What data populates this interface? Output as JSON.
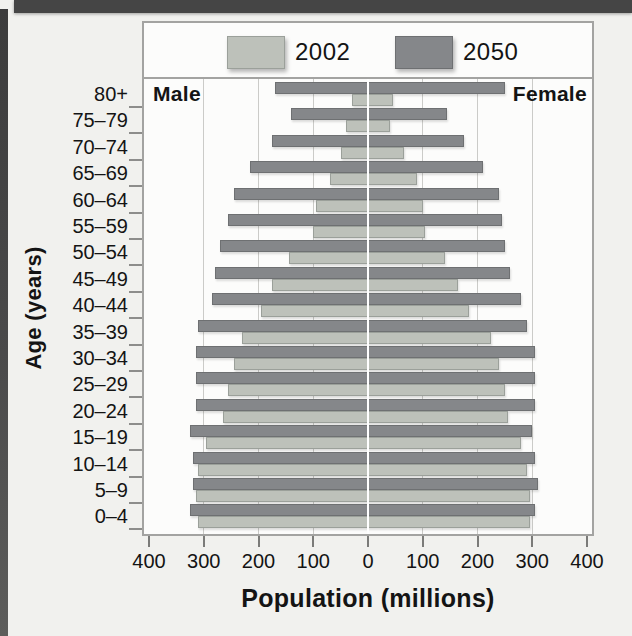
{
  "colors": {
    "page_bg": "#f1f1ee",
    "chart_bg": "#fcfcfb",
    "frame": "#a3a3a1",
    "grid": "#cbcbc8",
    "center_line": "#ffffff",
    "top_rule": "#454545",
    "text": "#141414"
  },
  "legend": {
    "items": [
      {
        "label": "2002",
        "color": "#bdc1ba",
        "border": "#9ba09a"
      },
      {
        "label": "2050",
        "color": "#85878a",
        "border": "#6e7072"
      }
    ]
  },
  "chart_data": {
    "type": "bar",
    "variant": "population_pyramid",
    "title": "",
    "xlabel": "Population (millions)",
    "ylabel": "Age (years)",
    "left_side_label": "Male",
    "right_side_label": "Female",
    "categories": [
      "80+",
      "75–79",
      "70–74",
      "65–69",
      "60–64",
      "55–59",
      "50–54",
      "45–49",
      "40–44",
      "35–39",
      "30–34",
      "25–29",
      "20–24",
      "15–19",
      "10–14",
      "5–9",
      "0–4"
    ],
    "x_max": 400,
    "x_tick_values": [
      -400,
      -300,
      -200,
      -100,
      0,
      100,
      200,
      300,
      400
    ],
    "x_tick_labels": [
      "400",
      "300",
      "200",
      "100",
      "0",
      "100",
      "200",
      "300",
      "400"
    ],
    "gridline_values": [
      100,
      200,
      300
    ],
    "grid": true,
    "legend_position": "top",
    "units": "millions of people",
    "series": [
      {
        "name": "2002",
        "side": "male",
        "values": [
          30,
          40,
          50,
          70,
          95,
          100,
          145,
          175,
          195,
          230,
          245,
          255,
          265,
          295,
          310,
          315,
          310
        ]
      },
      {
        "name": "2050",
        "side": "male",
        "values": [
          170,
          140,
          175,
          215,
          245,
          255,
          270,
          280,
          285,
          310,
          315,
          315,
          315,
          325,
          320,
          320,
          325
        ]
      },
      {
        "name": "2002",
        "side": "female",
        "values": [
          45,
          40,
          65,
          90,
          100,
          105,
          140,
          165,
          185,
          225,
          240,
          250,
          255,
          280,
          290,
          295,
          295
        ]
      },
      {
        "name": "2050",
        "side": "female",
        "values": [
          250,
          145,
          175,
          210,
          240,
          245,
          250,
          260,
          280,
          290,
          305,
          305,
          305,
          300,
          305,
          310,
          305
        ]
      }
    ]
  }
}
